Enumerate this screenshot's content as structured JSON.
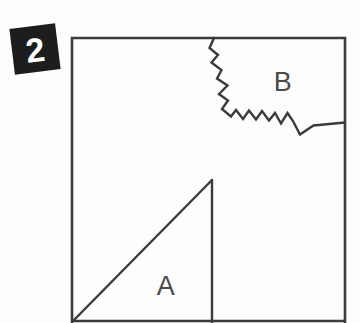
{
  "figure": {
    "number_badge": {
      "label": "2",
      "shape": "rotated-black-square",
      "rotation_deg": -7,
      "background_color": "#1d1d1d",
      "text_color": "#ffffff",
      "x": 12,
      "y": 26,
      "size": 46
    },
    "frame": {
      "name": "square-frame",
      "stroke_color": "#3b3b3b",
      "left": 72,
      "top": 38,
      "right": 345,
      "bottom": 323
    },
    "background_color": "#fdfdfd",
    "regions": [
      {
        "id": "A",
        "label": "A",
        "shape": "right-triangle",
        "label_x": 166,
        "label_y": 295,
        "description": "triangle in lower area with apex at top and vertical right edge"
      },
      {
        "id": "B",
        "label": "B",
        "shape": "jagged-polygon",
        "label_x": 283,
        "label_y": 91,
        "description": "upper-right region bounded by a zigzag boundary"
      }
    ],
    "paths": {
      "zigzag_boundary": "M 214,38 L 209.5,48 L 218,55 L 211.5,62.5 L 221.5,70 L 217,78.5 L 227.5,85.5 L 219,94 L 228,100.5 L 222,109 L 231,116.5 L 236,110 L 243,119 L 249,110.5 L 256,119.5 L 262,111 L 269,120.5 L 275,113 L 281,123.5 L 287.5,113 L 293,121 L 300,134.5 L 313.5,125.5 L 345,122.5",
      "triangle_hypotenuse": "M 212,180 L 73,321",
      "triangle_vertical": "M 212,180 L 212,323"
    }
  }
}
